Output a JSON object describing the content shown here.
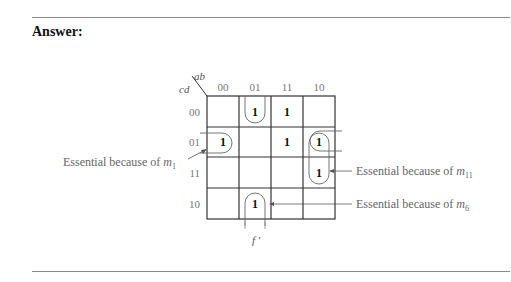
{
  "heading": "Answer:",
  "kmap": {
    "row_var": "cd",
    "col_var": "ab",
    "col_headers": [
      "00",
      "01",
      "11",
      "10"
    ],
    "row_headers": [
      "00",
      "01",
      "11",
      "10"
    ],
    "cells": [
      [
        "",
        "1",
        "1",
        ""
      ],
      [
        "1",
        "",
        "1",
        "1"
      ],
      [
        "",
        "",
        "",
        "1"
      ],
      [
        "",
        "1",
        "",
        ""
      ]
    ],
    "cell_value": "1",
    "function_label": "f ′"
  },
  "annotations": {
    "m1": {
      "text": "Essential because of ",
      "sub_var": "m",
      "sub": "1"
    },
    "m11": {
      "text": "Essential because of ",
      "sub_var": "m",
      "sub": "11"
    },
    "m6": {
      "text": "Essential because of ",
      "sub_var": "m",
      "sub": "6"
    }
  }
}
